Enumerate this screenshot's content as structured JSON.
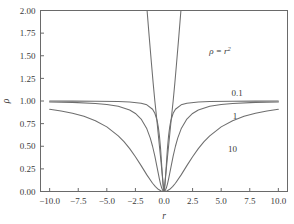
{
  "chart_data": {
    "type": "line",
    "title": "",
    "subtitle": "",
    "xlabel": "r",
    "ylabel": "ρ",
    "xlim": [
      -10.8,
      10.8
    ],
    "ylim": [
      0.0,
      2.0
    ],
    "xticks": [
      -10.0,
      -7.5,
      -5.0,
      -2.5,
      0.0,
      2.5,
      5.0,
      7.5,
      10.0
    ],
    "xticklabels": [
      "−10.0",
      "−7.5",
      "−5.0",
      "−2.5",
      "0.0",
      "2.5",
      "5.0",
      "7.5",
      "10.0"
    ],
    "yticks": [
      0.0,
      0.25,
      0.5,
      0.75,
      1.0,
      1.25,
      1.5,
      1.75,
      2.0
    ],
    "yticklabels": [
      "0.00",
      "0.25",
      "0.50",
      "0.75",
      "1.00",
      "1.25",
      "1.50",
      "1.75",
      "2.00"
    ],
    "grid": false,
    "legend_position": "inline-curve-labels",
    "annotations": [
      {
        "name": "rho-equals-r-squared",
        "text_base": "ρ = r",
        "text_sup": "2",
        "x": 4.9,
        "y": 1.52
      }
    ],
    "series": [
      {
        "name": "rho = 0.1",
        "label": "0.1",
        "formula": "r^2 / (0.1 + r^2)",
        "rho": 0.1,
        "label_x": 6.4,
        "label_y": 1.06,
        "color": "#6e6e6e",
        "points_x": [
          -10.0,
          -8.0,
          -6.0,
          -4.0,
          -3.0,
          -2.0,
          -1.5,
          -1.0,
          -0.8,
          -0.6,
          -0.5,
          -0.4,
          -0.3,
          -0.25,
          -0.2,
          -0.15,
          -0.1,
          -0.05,
          0.0,
          0.05,
          0.1,
          0.15,
          0.2,
          0.25,
          0.3,
          0.4,
          0.5,
          0.6,
          0.8,
          1.0,
          1.5,
          2.0,
          3.0,
          4.0,
          6.0,
          8.0,
          10.0
        ],
        "points_y": [
          0.999,
          0.9984,
          0.9972,
          0.9938,
          0.989,
          0.9756,
          0.9574,
          0.9091,
          0.8649,
          0.7826,
          0.7143,
          0.6154,
          0.4737,
          0.3846,
          0.2857,
          0.1837,
          0.0909,
          0.02439,
          0.0,
          0.02439,
          0.0909,
          0.1837,
          0.2857,
          0.3846,
          0.4737,
          0.6154,
          0.7143,
          0.7826,
          0.8649,
          0.9091,
          0.9574,
          0.9756,
          0.989,
          0.9938,
          0.9972,
          0.9984,
          0.999
        ]
      },
      {
        "name": "rho = 1",
        "label": "1",
        "formula": "r^2 / (1 + r^2)",
        "rho": 1,
        "label_x": 6.2,
        "label_y": 0.8,
        "color": "#6e6e6e",
        "points_x": [
          -10.0,
          -8.0,
          -6.0,
          -5.0,
          -4.0,
          -3.0,
          -2.5,
          -2.0,
          -1.5,
          -1.2,
          -1.0,
          -0.8,
          -0.6,
          -0.5,
          -0.4,
          -0.3,
          -0.2,
          -0.1,
          0.0,
          0.1,
          0.2,
          0.3,
          0.4,
          0.5,
          0.6,
          0.8,
          1.0,
          1.2,
          1.5,
          2.0,
          2.5,
          3.0,
          4.0,
          5.0,
          6.0,
          8.0,
          10.0
        ],
        "points_y": [
          0.9901,
          0.9846,
          0.973,
          0.9615,
          0.9412,
          0.9,
          0.8621,
          0.8,
          0.6923,
          0.5902,
          0.5,
          0.3902,
          0.2647,
          0.2,
          0.1379,
          0.0826,
          0.0385,
          0.0099,
          0.0,
          0.0099,
          0.0385,
          0.0826,
          0.1379,
          0.2,
          0.2647,
          0.3902,
          0.5,
          0.5902,
          0.6923,
          0.8,
          0.8621,
          0.9,
          0.9412,
          0.9615,
          0.973,
          0.9846,
          0.9901
        ]
      },
      {
        "name": "rho = 10",
        "label": "10",
        "formula": "r^2 / (10 + r^2)",
        "rho": 10,
        "label_x": 6.0,
        "label_y": 0.44,
        "color": "#6e6e6e",
        "points_x": [
          -10.0,
          -9.0,
          -8.0,
          -7.0,
          -6.0,
          -5.0,
          -4.0,
          -3.5,
          -3.0,
          -2.5,
          -2.0,
          -1.5,
          -1.0,
          -0.75,
          -0.5,
          -0.25,
          0.0,
          0.25,
          0.5,
          0.75,
          1.0,
          1.5,
          2.0,
          2.5,
          3.0,
          3.5,
          4.0,
          5.0,
          6.0,
          7.0,
          8.0,
          9.0,
          10.0
        ],
        "points_y": [
          0.9091,
          0.8901,
          0.8649,
          0.8305,
          0.7826,
          0.7143,
          0.6154,
          0.5508,
          0.4737,
          0.3846,
          0.2857,
          0.1837,
          0.0909,
          0.0532,
          0.0244,
          0.00621,
          0.0,
          0.00621,
          0.0244,
          0.0532,
          0.0909,
          0.1837,
          0.2857,
          0.3846,
          0.4737,
          0.5508,
          0.6154,
          0.7143,
          0.7826,
          0.8305,
          0.8649,
          0.8901,
          0.9091
        ]
      },
      {
        "name": "rho = r^2 (steep branch A)",
        "label": "",
        "formula": "r^2 / (r^2 + r^2) asymptote branch",
        "rho": null,
        "label_x": null,
        "label_y": null,
        "color": "#6e6e6e",
        "points_x": [
          -1.48,
          -1.3,
          -1.1,
          -0.95,
          -0.8,
          -0.65,
          -0.52,
          -0.4,
          -0.3,
          -0.22,
          -0.15,
          -0.09,
          -0.04,
          0.0,
          0.04,
          0.09,
          0.15,
          0.22,
          0.3,
          0.4,
          0.52,
          0.65,
          0.8,
          0.95,
          1.1,
          1.3,
          1.48
        ],
        "points_y": [
          2.0,
          1.72,
          1.42,
          1.2,
          1.0,
          0.82,
          0.655,
          0.5,
          0.375,
          0.275,
          0.188,
          0.113,
          0.05,
          0.0,
          0.05,
          0.113,
          0.188,
          0.275,
          0.375,
          0.5,
          0.655,
          0.82,
          1.0,
          1.2,
          1.42,
          1.72,
          2.0
        ]
      }
    ]
  },
  "figure": {
    "background": "#ffffff",
    "frame_color": "#6a6a6a",
    "text_color": "#3a3a3a",
    "curve_color": "#6e6e6e"
  }
}
